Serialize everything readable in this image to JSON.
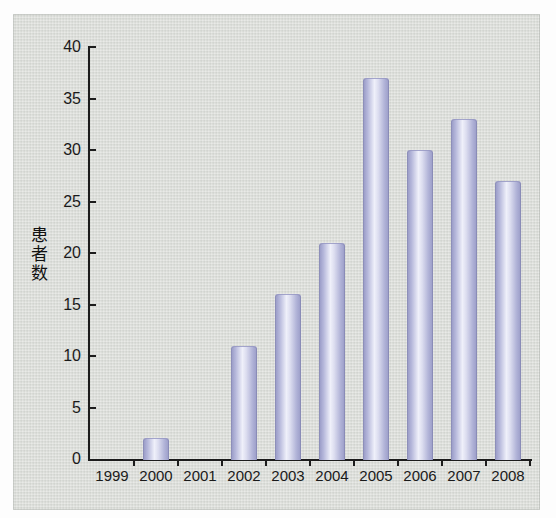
{
  "chart_data": {
    "type": "bar",
    "title": "",
    "xlabel": "",
    "ylabel": "患者数",
    "categories": [
      "1999",
      "2000",
      "2001",
      "2002",
      "2003",
      "2004",
      "2005",
      "2006",
      "2007",
      "2008"
    ],
    "values": [
      0,
      2,
      0,
      11,
      16,
      21,
      37,
      30,
      33,
      27
    ],
    "ylim": [
      0,
      40
    ],
    "yticks": [
      0,
      5,
      10,
      15,
      20,
      25,
      30,
      35,
      40
    ],
    "grid": false,
    "legend": false,
    "colors": {
      "panel_background": "#dcdeda",
      "bar_edge": "#9597c4",
      "bar_highlight": "#eff0fa",
      "axis": "#1c1c1c",
      "text": "#1a1a1a"
    }
  }
}
